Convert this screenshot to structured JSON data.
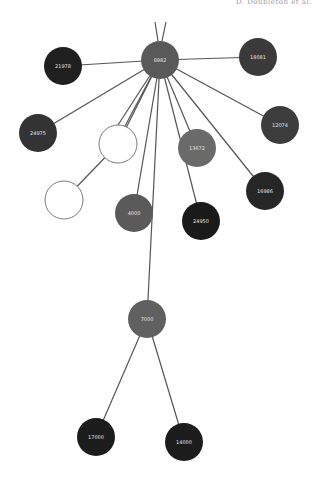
{
  "header": {
    "caption": "D. Doubleton et al."
  },
  "graph": {
    "node_radius": 19,
    "nodes": [
      {
        "id": "hub",
        "label": "8982",
        "x": 160,
        "y": 60,
        "fill": "#595959"
      },
      {
        "id": "n1",
        "label": "21978",
        "x": 63,
        "y": 66,
        "fill": "#1f1f1f"
      },
      {
        "id": "n2",
        "label": "18081",
        "x": 258,
        "y": 57,
        "fill": "#3a3a3a"
      },
      {
        "id": "n3",
        "label": "24975",
        "x": 38,
        "y": 133,
        "fill": "#333333"
      },
      {
        "id": "n4",
        "label": "12074",
        "x": 280,
        "y": 125,
        "fill": "#3d3d3d"
      },
      {
        "id": "w1",
        "label": "",
        "x": 118,
        "y": 144,
        "fill": "#ffffff"
      },
      {
        "id": "n5",
        "label": "13672",
        "x": 197,
        "y": 148,
        "fill": "#6a6a6a"
      },
      {
        "id": "n6",
        "label": "16986",
        "x": 265,
        "y": 191,
        "fill": "#262626"
      },
      {
        "id": "w2",
        "label": "",
        "x": 64,
        "y": 200,
        "fill": "#ffffff"
      },
      {
        "id": "n7",
        "label": "4000",
        "x": 134,
        "y": 213,
        "fill": "#5a5a5a"
      },
      {
        "id": "n8",
        "label": "24950",
        "x": 201,
        "y": 221,
        "fill": "#1a1a1a"
      },
      {
        "id": "n9",
        "label": "7000",
        "x": 147,
        "y": 319,
        "fill": "#606060"
      },
      {
        "id": "n10",
        "label": "17000",
        "x": 96,
        "y": 437,
        "fill": "#1c1c1c"
      },
      {
        "id": "n11",
        "label": "14000",
        "x": 184,
        "y": 442,
        "fill": "#1c1c1c"
      }
    ],
    "edges": [
      {
        "from": "hub",
        "to": "n1"
      },
      {
        "from": "hub",
        "to": "n2"
      },
      {
        "from": "hub",
        "to": "n3"
      },
      {
        "from": "hub",
        "to": "n4"
      },
      {
        "from": "hub",
        "to": "w1"
      },
      {
        "from": "hub",
        "to": "n5"
      },
      {
        "from": "hub",
        "to": "n6"
      },
      {
        "from": "hub",
        "to": "n7"
      },
      {
        "from": "hub",
        "to": "n8"
      },
      {
        "from": "hub",
        "to": "n9"
      },
      {
        "from": "w1",
        "to": "w2"
      },
      {
        "from": "n9",
        "to": "n10"
      },
      {
        "from": "n9",
        "to": "n11"
      }
    ],
    "offcanvas_edges": [
      {
        "x1": 158,
        "y1": 41,
        "x2": 155,
        "y2": 22
      },
      {
        "x1": 162,
        "y1": 41,
        "x2": 166,
        "y2": 22
      }
    ],
    "extra_hub_spokes": [
      {
        "x2": 118,
        "y2": 125
      },
      {
        "x2": 124,
        "y2": 128
      }
    ]
  },
  "colors": {
    "edge": "#555555",
    "label": "#e6e6e6",
    "white_node_stroke": "#7a7a7a"
  }
}
